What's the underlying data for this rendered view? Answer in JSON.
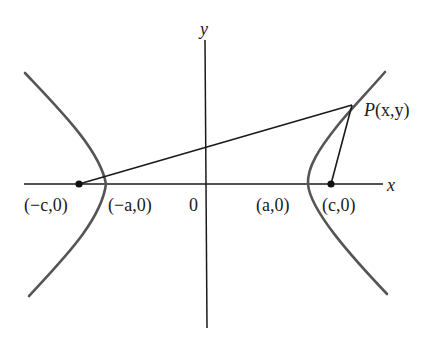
{
  "figure": {
    "type": "hyperbola-foci-diagram",
    "axes": {
      "x_label": "x",
      "y_label": "y",
      "origin_label": "0"
    },
    "points": {
      "left_focus": "(−c,0)",
      "left_vertex": "(−a,0)",
      "right_vertex": "(a,0)",
      "right_focus": "(c,0)",
      "point_p_name": "P",
      "point_p_coords": "(x,y)"
    },
    "colors": {
      "curve": "#555555",
      "lines": "#1a1a1a",
      "background": "#ffffff"
    }
  }
}
